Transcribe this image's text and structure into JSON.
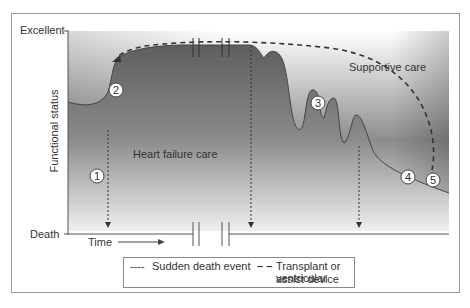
{
  "axes": {
    "y_label": "Functional status",
    "y_top": "Excellent",
    "y_bottom": "Death",
    "x_label": "Time"
  },
  "regions": {
    "heart_failure_care": "Heart failure care",
    "supportive_care": "Supportive care"
  },
  "markers": [
    "1",
    "2",
    "3",
    "4",
    "5"
  ],
  "legend": {
    "sudden_death_glyph": "----",
    "sudden_death": "Sudden death event",
    "transplant_glyph": "– –",
    "transplant_line1": "Transplant or ventricular",
    "transplant_line2": "assist device"
  },
  "colors": {
    "dark_gray": "#6a6a6a",
    "light_gray": "#f2f2f2",
    "line": "#444444"
  }
}
